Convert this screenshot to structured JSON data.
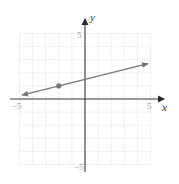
{
  "chart_data": {
    "type": "line",
    "title": "",
    "xlabel": "x",
    "ylabel": "y",
    "xlim": [
      -5,
      5
    ],
    "ylim": [
      -5,
      5
    ],
    "grid": true,
    "x_tick_labels": [
      "-5",
      "5"
    ],
    "y_tick_labels": [
      "5",
      "-5"
    ],
    "series": [
      {
        "name": "line",
        "equation": "y = 0.25x + 1.5",
        "slope": 0.25,
        "intercept": 1.5,
        "x": [
          -4.8,
          4.8
        ],
        "y": [
          0.3,
          2.7
        ],
        "arrows": "both"
      }
    ],
    "points": [
      {
        "x": -2,
        "y": 1
      }
    ],
    "colors": {
      "line": "#777777",
      "point": "#777777",
      "axis": "#3a3a3a",
      "grid": "#d6d6d6"
    }
  },
  "labels": {
    "x_axis": "x",
    "y_axis": "y",
    "x_min": "−5",
    "x_max": "5",
    "y_max": "5",
    "y_min": "−5"
  }
}
